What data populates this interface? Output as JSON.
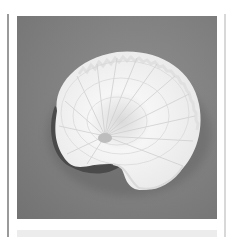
{
  "image": {
    "subject": "paper nautilus shell",
    "alt": "White ribbed spiral shell with serrated edge on a gray background",
    "background_color": "#7e7e7e",
    "shell_color": "#f2f2f2"
  }
}
